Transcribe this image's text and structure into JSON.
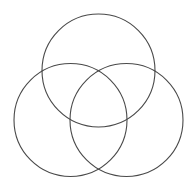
{
  "figure": {
    "type": "venn-diagram",
    "canvas": {
      "width": 196,
      "height": 191,
      "background_color": "#ffffff"
    },
    "style": {
      "stroke_color": "#494949",
      "stroke_width": 1.1,
      "fill": "none"
    },
    "circle_count": 3,
    "circles": [
      {
        "id": "circle-top",
        "label": "top-circle",
        "cx": 98.5,
        "cy": 70.5,
        "r": 56.5
      },
      {
        "id": "circle-bottom-left",
        "label": "bottom-left-circle",
        "cx": 70.5,
        "cy": 120.0,
        "r": 56.5
      },
      {
        "id": "circle-bottom-right",
        "label": "bottom-right-circle",
        "cx": 126.5,
        "cy": 120.0,
        "r": 56.5
      }
    ],
    "intersection_points": [
      {
        "id": "top-left-crossing",
        "x": 43,
        "y": 70
      },
      {
        "id": "top-right-crossing",
        "x": 150,
        "y": 68
      },
      {
        "id": "bottom-center-crossing",
        "x": 98,
        "y": 167
      },
      {
        "id": "center-crossing",
        "x": 98,
        "y": 76
      }
    ]
  }
}
